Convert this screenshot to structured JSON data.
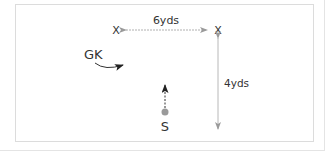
{
  "diagram": {
    "labels": {
      "width_distance": "6yds",
      "height_distance": "4yds",
      "cone_left": "X",
      "cone_right": "X",
      "goalkeeper": "GK",
      "striker": "S"
    },
    "colors": {
      "text": "#333333",
      "arrow_grey": "#9a9a9a",
      "arrow_dark": "#222222",
      "ball": "#9a9a9a",
      "border": "#dcdcdc"
    }
  }
}
